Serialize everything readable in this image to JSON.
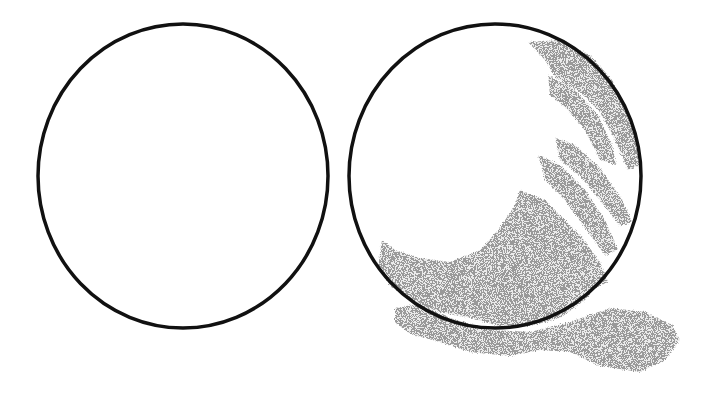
{
  "scene": {
    "description": "Two outlined circles side by side; the right circle is partially filled with gray crayon-like scribble strokes that extend beyond its lower edge",
    "background": "#ffffff",
    "circles": [
      {
        "name": "empty-circle",
        "cx": 183,
        "cy": 176,
        "rx": 145,
        "ry": 152,
        "stroke": "#111111",
        "stroke_width": 3.5,
        "filled": false
      },
      {
        "name": "scribbled-circle",
        "cx": 495,
        "cy": 176,
        "rx": 146,
        "ry": 152,
        "stroke": "#111111",
        "stroke_width": 3.5,
        "filled": true
      }
    ],
    "scribble_color": "#999999"
  }
}
